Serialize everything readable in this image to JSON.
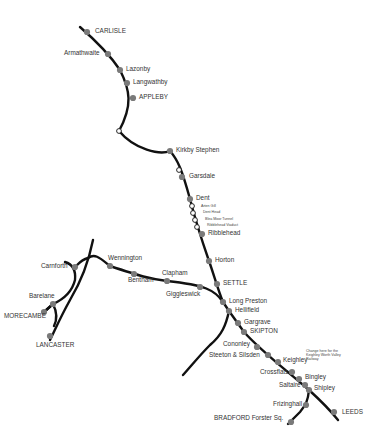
{
  "map": {
    "title": "Settle-Carlisle Railway route map",
    "colors": {
      "line": "#111111",
      "station": "#7a7a7a",
      "request_stop": "#ffffff",
      "text": "#333333"
    },
    "stations": [
      {
        "id": "carlisle",
        "label": "CARLISLE",
        "x": 87,
        "y": 32,
        "type": "major"
      },
      {
        "id": "armathwaite",
        "label": "Armathwaite",
        "x": 108,
        "y": 54,
        "type": "station"
      },
      {
        "id": "lazonby",
        "label": "Lazonby",
        "x": 120,
        "y": 70,
        "type": "station"
      },
      {
        "id": "langwathby",
        "label": "Langwathby",
        "x": 127,
        "y": 83,
        "type": "station"
      },
      {
        "id": "appleby",
        "label": "APPLEBY",
        "x": 133,
        "y": 98,
        "type": "major"
      },
      {
        "id": "kirkby-stephen",
        "label": "Kirkby Stephen",
        "x": 170,
        "y": 151,
        "type": "station"
      },
      {
        "id": "garsdale",
        "label": "Garsdale",
        "x": 182,
        "y": 177,
        "type": "station"
      },
      {
        "id": "dent",
        "label": "Dent",
        "x": 190,
        "y": 199,
        "type": "station"
      },
      {
        "id": "ribblehead",
        "label": "Ribblehead",
        "x": 202,
        "y": 234,
        "type": "station"
      },
      {
        "id": "horton",
        "label": "Horton",
        "x": 209,
        "y": 261,
        "type": "station"
      },
      {
        "id": "settle",
        "label": "SETTLE",
        "x": 217,
        "y": 284,
        "type": "major"
      },
      {
        "id": "long-preston",
        "label": "Long Preston",
        "x": 223,
        "y": 302,
        "type": "station"
      },
      {
        "id": "hellifield",
        "label": "Hellifield",
        "x": 229,
        "y": 311,
        "type": "station"
      },
      {
        "id": "gargrave",
        "label": "Gargrave",
        "x": 238,
        "y": 323,
        "type": "station"
      },
      {
        "id": "skipton",
        "label": "SKIPTON",
        "x": 244,
        "y": 332,
        "type": "major"
      },
      {
        "id": "cononley",
        "label": "Cononley",
        "x": 257,
        "y": 347,
        "type": "station"
      },
      {
        "id": "steeton-silsden",
        "label": "Steeton & Silsden",
        "x": 268,
        "y": 355,
        "type": "station"
      },
      {
        "id": "keighley",
        "label": "Keighley",
        "x": 278,
        "y": 362,
        "type": "station"
      },
      {
        "id": "crossflats",
        "label": "Crossflats",
        "x": 292,
        "y": 372,
        "type": "station"
      },
      {
        "id": "bingley",
        "label": "Bingley",
        "x": 299,
        "y": 379,
        "type": "station"
      },
      {
        "id": "saltaire",
        "label": "Saltaire",
        "x": 305,
        "y": 385,
        "type": "station"
      },
      {
        "id": "shipley",
        "label": "Shipley",
        "x": 309,
        "y": 390,
        "type": "station"
      },
      {
        "id": "frizinghall",
        "label": "Frizinghall",
        "x": 306,
        "y": 405,
        "type": "station"
      },
      {
        "id": "bradford",
        "label": "BRADFORD Forster Sq.",
        "x": 291,
        "y": 422,
        "type": "major"
      },
      {
        "id": "leeds",
        "label": "LEEDS",
        "x": 334,
        "y": 412,
        "type": "major"
      },
      {
        "id": "giggleswick",
        "label": "Giggleswick",
        "x": 200,
        "y": 287,
        "type": "station"
      },
      {
        "id": "clapham",
        "label": "Clapham",
        "x": 167,
        "y": 281,
        "type": "station"
      },
      {
        "id": "bentham",
        "label": "Bentham",
        "x": 134,
        "y": 274,
        "type": "station"
      },
      {
        "id": "wennington",
        "label": "Wennington",
        "x": 110,
        "y": 266,
        "type": "station"
      },
      {
        "id": "carnforth",
        "label": "Carnforth",
        "x": 75,
        "y": 267,
        "type": "station"
      },
      {
        "id": "bare-lane",
        "label": "Barelane",
        "x": 53,
        "y": 304,
        "type": "station"
      },
      {
        "id": "morecambe",
        "label": "MORECAMBE",
        "x": 44,
        "y": 312,
        "type": "major"
      },
      {
        "id": "lancaster",
        "label": "LANCASTER",
        "x": 50,
        "y": 336,
        "type": "major"
      }
    ],
    "request_stops": [
      {
        "x": 119,
        "y": 131
      },
      {
        "x": 179,
        "y": 170
      },
      {
        "x": 192,
        "y": 206
      },
      {
        "x": 193,
        "y": 213
      },
      {
        "x": 195,
        "y": 220
      },
      {
        "x": 197,
        "y": 227
      }
    ],
    "landmarks": [
      {
        "label": "Arten Gill",
        "x": 201,
        "y": 207
      },
      {
        "label": "Dent Head",
        "x": 203,
        "y": 213
      },
      {
        "label": "Blea Moor Tunnel",
        "x": 205,
        "y": 220
      },
      {
        "label": "Ribblehead Viaduct",
        "x": 207,
        "y": 226
      }
    ],
    "note": {
      "text": "Change here for the Keighley Worth Valley Railway",
      "x": 306,
      "y": 349
    }
  }
}
